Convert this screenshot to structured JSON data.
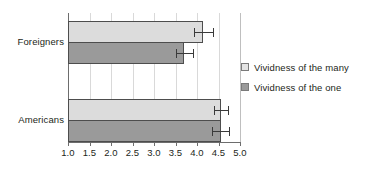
{
  "chart_data": {
    "type": "bar",
    "orientation": "horizontal",
    "title": "",
    "xlabel": "",
    "ylabel": "",
    "categories": [
      "Foreigners",
      "Americans"
    ],
    "series": [
      {
        "name": "Vividness of the many",
        "key": "many",
        "color": "#dcdcdc",
        "values": [
          4.15,
          4.55
        ],
        "errors": [
          0.22,
          0.16
        ]
      },
      {
        "name": "Vividness of the one",
        "key": "one",
        "color": "#9a9a9a",
        "values": [
          3.7,
          4.55
        ],
        "errors": [
          0.2,
          0.2
        ]
      }
    ],
    "xlim": [
      1.0,
      5.0
    ],
    "xticks": [
      1.0,
      1.5,
      2.0,
      2.5,
      3.0,
      3.5,
      4.0,
      4.5,
      5.0
    ],
    "xtick_labels": [
      "1.0",
      "1.5",
      "2.0",
      "2.5",
      "3.0",
      "3.5",
      "4.0",
      "4.5",
      "5.0"
    ],
    "grid": true,
    "grid_axis": "x",
    "legend_position": "right",
    "error_bars": true
  },
  "axis": {
    "category_labels": [
      "Foreigners",
      "Americans"
    ],
    "tick_labels": [
      "1.0",
      "1.5",
      "2.0",
      "2.5",
      "3.0",
      "3.5",
      "4.0",
      "4.5",
      "5.0"
    ]
  },
  "legend": {
    "items": [
      {
        "label": "Vividness of the many",
        "swatch": "many"
      },
      {
        "label": "Vividness of the one",
        "swatch": "one"
      }
    ]
  },
  "colors": {
    "series_many": "#dcdcdc",
    "series_one": "#9a9a9a",
    "bar_border": "#4d4d4d",
    "gridline": "#d9d9d9",
    "axis": "#6d6d6d",
    "text": "#231f20",
    "background": "#ffffff"
  }
}
